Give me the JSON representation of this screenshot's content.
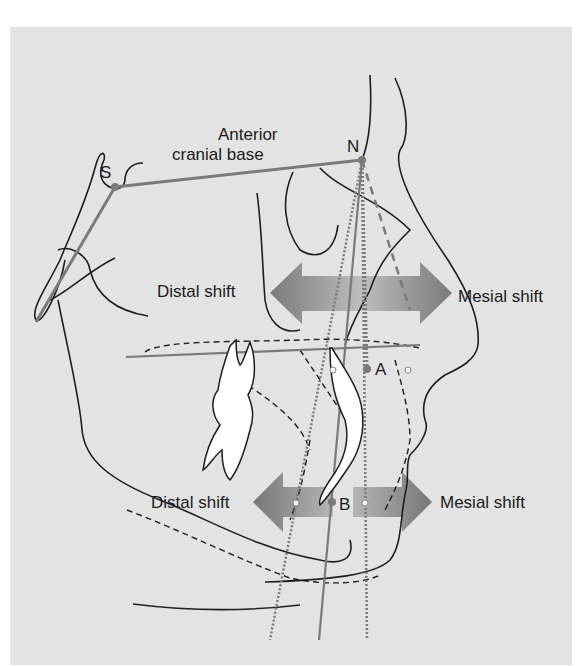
{
  "figure": {
    "labels": {
      "anterior_line1": "Anterior",
      "anterior_line2": "cranial base",
      "point_s": "S",
      "point_n": "N",
      "point_a": "A",
      "point_b": "B",
      "upper_distal": "Distal shift",
      "upper_mesial": "Mesial shift",
      "lower_distal": "Distal shift",
      "lower_mesial": "Mesial shift"
    },
    "colors": {
      "background": "#e3e3e3",
      "line": "#1e1e1e",
      "reference_line": "#7a7a7a",
      "arrow_dark": "#7d7d7d",
      "arrow_light": "#b8b8b8",
      "tooth_fill": "#ffffff"
    }
  }
}
